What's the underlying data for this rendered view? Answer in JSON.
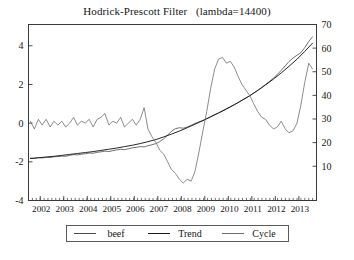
{
  "chart_data": {
    "type": "line",
    "title": "Hodrick-Prescott Filter   (lambda=14400)",
    "xlabel": "",
    "ylabel_left": "",
    "ylabel_right": "",
    "grid": false,
    "legend_position": "bottom",
    "xlim": [
      2001.5,
      2013.75
    ],
    "ylim_left": [
      -4,
      5.1
    ],
    "ylim_right": [
      -4.5,
      70
    ],
    "x_tick_labels": [
      "2002",
      "2003",
      "2004",
      "2005",
      "2006",
      "2007",
      "2008",
      "2009",
      "2010",
      "2011",
      "2012",
      "2013"
    ],
    "x_ticks": [
      2002,
      2003,
      2004,
      2005,
      2006,
      2007,
      2008,
      2009,
      2010,
      2011,
      2012,
      2013
    ],
    "y_left_ticks": [
      -4,
      -2,
      0,
      2,
      4
    ],
    "y_left_tick_labels": [
      "-4",
      "-2",
      "0",
      "2",
      "4"
    ],
    "y_right_ticks": [
      10,
      20,
      30,
      40,
      50,
      60,
      70
    ],
    "y_right_tick_labels": [
      "10",
      "20",
      "30",
      "40",
      "50",
      "60",
      "70"
    ],
    "series": [
      {
        "name": "beef",
        "axis": "right",
        "color": "#4d4d4d",
        "x": [
          2001.58,
          2001.75,
          2001.92,
          2002.08,
          2002.25,
          2002.42,
          2002.58,
          2002.75,
          2002.92,
          2003.08,
          2003.25,
          2003.42,
          2003.58,
          2003.75,
          2003.92,
          2004.08,
          2004.25,
          2004.42,
          2004.58,
          2004.75,
          2004.92,
          2005.08,
          2005.25,
          2005.42,
          2005.58,
          2005.75,
          2005.92,
          2006.08,
          2006.25,
          2006.42,
          2006.58,
          2006.75,
          2006.92,
          2007.08,
          2007.25,
          2007.42,
          2007.58,
          2007.75,
          2007.92,
          2008.08,
          2008.25,
          2008.42,
          2008.58,
          2008.75,
          2008.92,
          2009.08,
          2009.25,
          2009.42,
          2009.58,
          2009.75,
          2009.92,
          2010.08,
          2010.25,
          2010.42,
          2010.58,
          2010.75,
          2010.92,
          2011.08,
          2011.25,
          2011.42,
          2011.58,
          2011.75,
          2011.92,
          2012.08,
          2012.25,
          2012.42,
          2012.58,
          2012.75,
          2012.92,
          2013.08,
          2013.25,
          2013.42,
          2013.58
        ],
        "values": [
          13.4,
          13.3,
          13.6,
          13.5,
          13.8,
          13.7,
          14.0,
          14.1,
          14.3,
          14.2,
          14.6,
          14.9,
          14.8,
          15.1,
          15.3,
          15.6,
          15.5,
          15.9,
          16.1,
          16.4,
          16.2,
          16.6,
          16.9,
          17.2,
          17.0,
          17.4,
          17.8,
          18.0,
          18.3,
          18.2,
          18.7,
          19.1,
          19.6,
          20.4,
          21.6,
          23.2,
          24.8,
          25.9,
          26.3,
          26.1,
          26.6,
          27.3,
          28.1,
          28.8,
          29.4,
          30.2,
          31.0,
          31.9,
          32.6,
          33.5,
          34.4,
          35.2,
          36.1,
          37.0,
          38.0,
          38.9,
          39.9,
          41.0,
          42.1,
          43.3,
          44.6,
          45.9,
          47.3,
          48.8,
          50.6,
          52.5,
          54.3,
          55.8,
          57.0,
          58.0,
          60.2,
          62.8,
          64.8
        ]
      },
      {
        "name": "Trend",
        "axis": "right",
        "color": "#1a1a1a",
        "x": [
          2001.58,
          2001.92,
          2002.25,
          2002.58,
          2002.92,
          2003.25,
          2003.58,
          2003.92,
          2004.25,
          2004.58,
          2004.92,
          2005.25,
          2005.58,
          2005.92,
          2006.25,
          2006.58,
          2006.92,
          2007.25,
          2007.58,
          2007.92,
          2008.25,
          2008.58,
          2008.92,
          2009.25,
          2009.58,
          2009.92,
          2010.25,
          2010.58,
          2010.92,
          2011.25,
          2011.58,
          2011.92,
          2012.25,
          2012.58,
          2012.92,
          2013.25,
          2013.58
        ],
        "values": [
          13.3,
          13.6,
          13.9,
          14.2,
          14.6,
          15.0,
          15.4,
          15.8,
          16.2,
          16.7,
          17.2,
          17.7,
          18.3,
          18.9,
          19.6,
          20.4,
          21.3,
          22.4,
          23.6,
          24.9,
          26.3,
          27.8,
          29.3,
          30.9,
          32.5,
          34.2,
          36.0,
          37.9,
          39.9,
          42.1,
          44.4,
          46.9,
          49.5,
          52.3,
          55.3,
          58.6,
          62.1
        ]
      },
      {
        "name": "Cycle",
        "axis": "left",
        "color": "#6e6e6e",
        "x": [
          2001.58,
          2001.75,
          2001.92,
          2002.08,
          2002.25,
          2002.42,
          2002.58,
          2002.75,
          2002.92,
          2003.08,
          2003.25,
          2003.42,
          2003.58,
          2003.75,
          2003.92,
          2004.08,
          2004.25,
          2004.42,
          2004.58,
          2004.75,
          2004.92,
          2005.08,
          2005.25,
          2005.42,
          2005.58,
          2005.75,
          2005.92,
          2006.08,
          2006.25,
          2006.42,
          2006.58,
          2006.75,
          2006.92,
          2007.08,
          2007.25,
          2007.42,
          2007.58,
          2007.75,
          2007.92,
          2008.08,
          2008.25,
          2008.42,
          2008.58,
          2008.75,
          2008.92,
          2009.08,
          2009.25,
          2009.42,
          2009.58,
          2009.75,
          2009.92,
          2010.08,
          2010.25,
          2010.42,
          2010.58,
          2010.75,
          2010.92,
          2011.08,
          2011.25,
          2011.42,
          2011.58,
          2011.75,
          2011.92,
          2012.08,
          2012.25,
          2012.42,
          2012.58,
          2012.75,
          2012.92,
          2013.08,
          2013.25,
          2013.42,
          2013.58
        ],
        "values": [
          0.1,
          -0.3,
          0.2,
          -0.1,
          0.2,
          -0.2,
          0.1,
          -0.1,
          0.1,
          -0.2,
          0.0,
          0.3,
          -0.1,
          0.1,
          0.0,
          0.2,
          -0.2,
          0.2,
          0.3,
          0.5,
          -0.1,
          0.1,
          0.0,
          0.3,
          -0.2,
          0.0,
          0.2,
          -0.1,
          0.2,
          0.8,
          -0.3,
          -0.7,
          -1.0,
          -1.4,
          -1.6,
          -2.0,
          -2.4,
          -2.6,
          -2.9,
          -3.1,
          -2.9,
          -3.0,
          -2.5,
          -1.5,
          -0.4,
          0.6,
          1.8,
          2.8,
          3.3,
          3.4,
          3.1,
          3.2,
          2.9,
          2.4,
          2.0,
          1.7,
          1.4,
          1.0,
          0.6,
          0.3,
          0.2,
          -0.1,
          -0.3,
          -0.2,
          0.1,
          -0.3,
          -0.5,
          -0.4,
          0.0,
          0.9,
          2.1,
          3.1,
          2.8
        ]
      }
    ]
  },
  "legend": {
    "items": [
      {
        "label": "beef",
        "color": "#4d4d4d"
      },
      {
        "label": "Trend",
        "color": "#1a1a1a"
      },
      {
        "label": "Cycle",
        "color": "#6e6e6e"
      }
    ]
  },
  "caption": ""
}
